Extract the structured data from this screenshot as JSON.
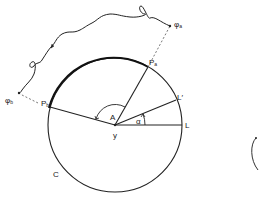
{
  "diagram": {
    "labels": {
      "pa": "P",
      "pa_sub": "a",
      "pb": "P",
      "pb_sub": "b",
      "phi_a": "φ",
      "phi_a_sub": "a",
      "phi_b": "φ",
      "phi_b_sub": "b",
      "angle_A": "A",
      "center_y": "y",
      "alpha": "α",
      "L": "L",
      "L_prime": "L′",
      "circle": "C"
    },
    "colors": {
      "stroke": "#222222",
      "background": "#ffffff"
    }
  }
}
